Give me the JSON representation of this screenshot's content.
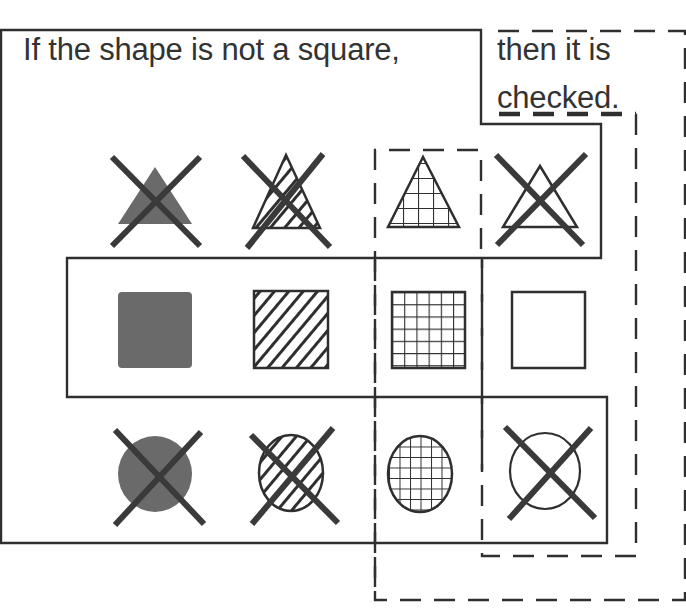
{
  "caption": {
    "part1": "If the shape is not a square,",
    "part2_line1": "then it is",
    "part2_line2": "checked."
  },
  "colors": {
    "stroke": "#2f2f2f",
    "solid_fill": "#6a6a6a",
    "background": "#ffffff"
  },
  "regions": {
    "not_square": {
      "style": "solid",
      "description": "Outline enclosing all non-square shapes (triangles and circles)"
    },
    "checked": {
      "style": "dashed",
      "description": "Outline enclosing shapes that are checked (grid pattern column)"
    }
  },
  "grid": {
    "rows": [
      "triangle",
      "square",
      "circle"
    ],
    "columns": [
      "solid",
      "striped",
      "checked",
      "empty"
    ],
    "cells": [
      [
        {
          "shape": "triangle",
          "pattern": "solid",
          "crossed": true
        },
        {
          "shape": "triangle",
          "pattern": "striped",
          "crossed": true
        },
        {
          "shape": "triangle",
          "pattern": "checked",
          "crossed": false
        },
        {
          "shape": "triangle",
          "pattern": "empty",
          "crossed": true
        }
      ],
      [
        {
          "shape": "square",
          "pattern": "solid",
          "crossed": false
        },
        {
          "shape": "square",
          "pattern": "striped",
          "crossed": false
        },
        {
          "shape": "square",
          "pattern": "checked",
          "crossed": false
        },
        {
          "shape": "square",
          "pattern": "empty",
          "crossed": false
        }
      ],
      [
        {
          "shape": "circle",
          "pattern": "solid",
          "crossed": true
        },
        {
          "shape": "circle",
          "pattern": "striped",
          "crossed": true
        },
        {
          "shape": "circle",
          "pattern": "checked",
          "crossed": false
        },
        {
          "shape": "circle",
          "pattern": "empty",
          "crossed": true
        }
      ]
    ]
  }
}
